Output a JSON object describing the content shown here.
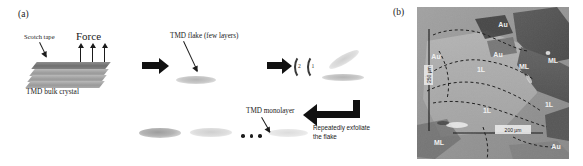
{
  "figure": {
    "panels": [
      {
        "id": "a",
        "letter": "(a)"
      },
      {
        "id": "b",
        "letter": "(b)"
      }
    ]
  },
  "panel_a": {
    "letter": "(a)",
    "labels": {
      "scotch_tape": "Scotch tape",
      "force": "Force",
      "bulk_crystal": "TMD bulk crystal",
      "tmd_flake": "TMD flake (few layers)",
      "tmd_monolayer": "TMD monolayer",
      "repeat_line1": "Repeatedly exfoliate",
      "repeat_line2": "the flake",
      "ellipsis": "•  •  •"
    },
    "arc_numbers": [
      "2",
      "1"
    ],
    "force_arrow_count": 3,
    "crystal_layer_count": 4
  },
  "panel_b": {
    "letter": "(b)",
    "region_labels": [
      {
        "text": "Au",
        "x": 86,
        "y": 20
      },
      {
        "text": "Au",
        "x": 19,
        "y": 52
      },
      {
        "text": "Au",
        "x": 81,
        "y": 50
      },
      {
        "text": "Au",
        "x": 139,
        "y": 142
      },
      {
        "text": "1L",
        "x": 64,
        "y": 65
      },
      {
        "text": "1L",
        "x": 70,
        "y": 106
      },
      {
        "text": "1L",
        "x": 132,
        "y": 100
      },
      {
        "text": "ML",
        "x": 107,
        "y": 62
      },
      {
        "text": "ML",
        "x": 136,
        "y": 56
      },
      {
        "text": "ML",
        "x": 22,
        "y": 138
      }
    ],
    "scale_bar": {
      "label": "200 µm",
      "length_px": 62
    },
    "vertical_marker": {
      "label": "250 µm"
    }
  },
  "colors": {
    "ink": "#1a1a1a",
    "arrow": "#111111",
    "slab_top": "#6f6f6f",
    "slab_sub": "#9a9a9a",
    "micrograph_base": "#8d8d8d",
    "background": "#ffffff"
  }
}
